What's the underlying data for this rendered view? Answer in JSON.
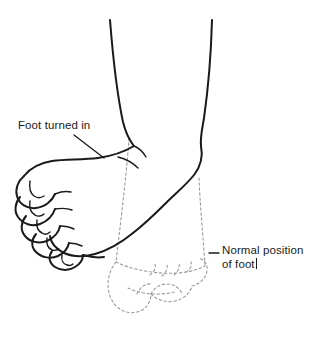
{
  "figure": {
    "background_color": "#ffffff",
    "ink_color": "#1a1a1a",
    "ghost_color": "#9a9a9a",
    "width": 322,
    "height": 346
  },
  "annotations": {
    "turned_in": {
      "text": "Foot turned in",
      "leader": "diagonal line from label down-right to top of foot"
    },
    "normal_position": {
      "line1": "Normal position",
      "line2": "of foot",
      "leader": "short horizontal dash to dashed outline"
    }
  },
  "parts": {
    "leg": "lower leg shown as two tapering contour lines",
    "solid_foot": "foot inverted (turned inward), toes pointing left",
    "ghost_foot": "dashed outline of foot in normal position, toes pointing right",
    "toe_count": 5
  }
}
